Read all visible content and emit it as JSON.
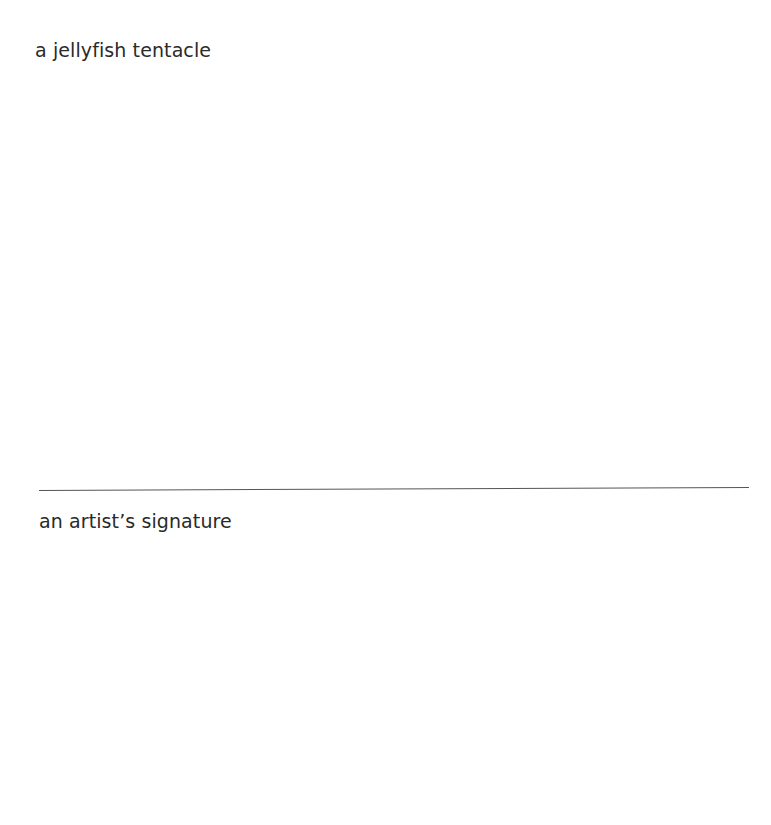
{
  "sections": [
    {
      "prompt": "a jellyfish tentacle"
    },
    {
      "prompt": "an artist’s signature"
    }
  ],
  "colors": {
    "text": "#2a2a2a",
    "rule": "#555555",
    "background": "#ffffff"
  }
}
